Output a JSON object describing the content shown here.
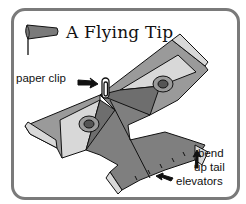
{
  "title": "A Flying Tip",
  "labels": {
    "paper_clip": "paper clip",
    "bend_line1": "bend",
    "bend_line2": "up tail",
    "bend_line3": "elevators"
  },
  "icons": {
    "windsock": "windsock-icon",
    "plane": "paper-airplane-illustration",
    "clip": "paper-clip-icon"
  },
  "colors": {
    "frame": "#7a7a7a",
    "dark_fill": "#6e6e6e",
    "mid_fill": "#9a9a9a",
    "light_fill": "#d8d8d8",
    "outline": "#111111"
  }
}
